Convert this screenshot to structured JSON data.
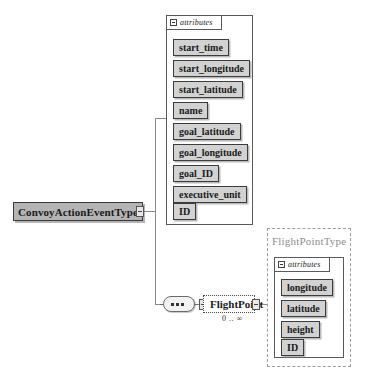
{
  "diagram": {
    "kind": "xml-schema-diagram",
    "root": {
      "name": "ConvoyActionEventType",
      "attributes_label": "attributes",
      "attributes": [
        "start_time",
        "start_longitude",
        "start_latitude",
        "name",
        "goal_latitude",
        "goal_longitude",
        "goal_ID",
        "executive_unit",
        "ID"
      ]
    },
    "sequence": {
      "compositor": "sequence",
      "element": {
        "name": "FlightPoint",
        "occurrence": "0 .. ∞"
      }
    },
    "referenced_type": {
      "name": "FlightPointType",
      "attributes_label": "attributes",
      "attributes": [
        "longitude",
        "latitude",
        "height",
        "ID"
      ]
    }
  },
  "colors": {
    "type_fill": "#b4b4b4",
    "attribute_fill": "#d2d2d2",
    "border": "#3c3c3c",
    "line": "#8a8a8a",
    "group_border": "#9a9a9a",
    "group_title": "#8d8d8d"
  }
}
